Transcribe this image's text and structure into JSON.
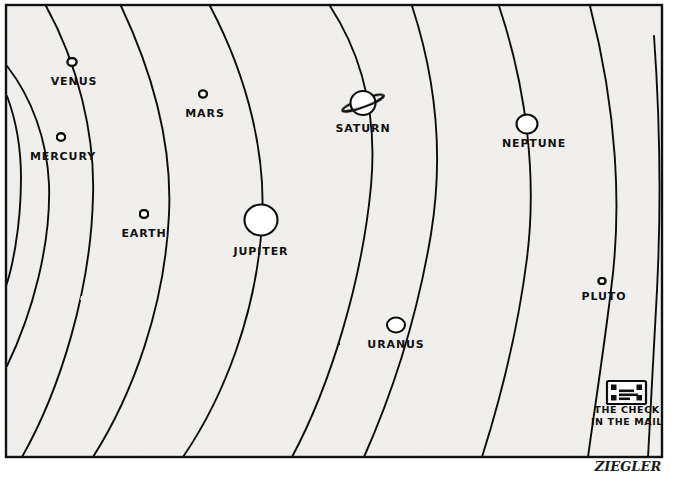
{
  "artwork": {
    "kind": "single-panel-cartoon",
    "medium": "pen-and-ink drawing",
    "subject": "solar system diagram with an extra orbit labeled The Check In The Mail",
    "signature": "ZIEGLER",
    "background_color": "#f2f1ee",
    "ink_color": "#111111",
    "page_color": "#ffffff",
    "frame": {
      "x": 6,
      "y": 5,
      "width": 656,
      "height": 452,
      "stroke": "#111111"
    }
  },
  "caption": {
    "line1": "THE CHECK",
    "line2": "IN THE MAIL"
  },
  "planets": [
    {
      "name": "MERCURY",
      "icon": "small-circle-icon",
      "cx": 61,
      "cy": 137,
      "rx": 4.2,
      "ry": 3.8,
      "label_x": 63,
      "label_y": 160,
      "label_size": 11
    },
    {
      "name": "VENUS",
      "icon": "small-circle-icon",
      "cx": 72,
      "cy": 62,
      "rx": 4.6,
      "ry": 4.0,
      "label_x": 74,
      "label_y": 85,
      "label_size": 11
    },
    {
      "name": "EARTH",
      "icon": "small-circle-icon",
      "cx": 144,
      "cy": 214,
      "rx": 4.3,
      "ry": 4.0,
      "label_x": 144,
      "label_y": 237,
      "label_size": 11
    },
    {
      "name": "MARS",
      "icon": "small-circle-icon",
      "cx": 203,
      "cy": 94,
      "rx": 4.0,
      "ry": 3.6,
      "label_x": 205,
      "label_y": 117,
      "label_size": 11
    },
    {
      "name": "JUPITER",
      "icon": "large-circle-icon",
      "cx": 261,
      "cy": 220,
      "rx": 16.5,
      "ry": 15.5,
      "label_x": 261,
      "label_y": 255,
      "label_size": 11
    },
    {
      "name": "SATURN",
      "icon": "ringed-planet-icon",
      "cx": 363,
      "cy": 103,
      "rx": 12.5,
      "ry": 12.0,
      "label_x": 363,
      "label_y": 132,
      "label_size": 11
    },
    {
      "name": "URANUS",
      "icon": "small-ellipse-icon",
      "cx": 396,
      "cy": 325,
      "rx": 9.0,
      "ry": 7.5,
      "label_x": 396,
      "label_y": 348,
      "label_size": 11
    },
    {
      "name": "NEPTUNE",
      "icon": "medium-circle-icon",
      "cx": 527,
      "cy": 124,
      "rx": 10.5,
      "ry": 9.5,
      "label_x": 534,
      "label_y": 147,
      "label_size": 11
    },
    {
      "name": "PLUTO",
      "icon": "tiny-circle-icon",
      "cx": 602,
      "cy": 281,
      "rx": 3.6,
      "ry": 3.3,
      "label_x": 604,
      "label_y": 300,
      "label_size": 11
    }
  ],
  "check_object": {
    "icon": "check-envelope-icon",
    "x": 607,
    "y": 381,
    "width": 39,
    "height": 23,
    "label_x": 627,
    "label_y": 413,
    "label_size": 9.5
  },
  "orbits": [
    {
      "id": "orbit-mercury",
      "d": "M 7 96 C 16 120 21 150 21 178 C 21 230 11 272 6 286"
    },
    {
      "id": "orbit-venus",
      "d": "M 7 66 C 32 98 47 140 49 184 C 51 244 33 312 7 366"
    },
    {
      "id": "orbit-earth",
      "d": "M 46 6 C 78 64 95 135 93 196 C 91 290 60 390 22 457"
    },
    {
      "id": "orbit-mars",
      "d": "M 121 6 C 155 78 172 150 169 214 C 165 306 133 394 93 457"
    },
    {
      "id": "orbit-jupiter",
      "d": "M 210 6 C 249 80 266 156 262 222 C 257 312 224 397 183 457"
    },
    {
      "id": "orbit-saturn",
      "d": "M 330 6 C 364 58 377 120 371 186 C 362 282 330 386 292 457"
    },
    {
      "id": "orbit-uranus",
      "d": "M 412 6 C 437 82 443 160 431 234 C 417 318 392 394 364 457"
    },
    {
      "id": "orbit-neptune",
      "d": "M 499 6 C 527 90 537 178 527 258 C 518 330 500 400 482 457"
    },
    {
      "id": "orbit-pluto",
      "d": "M 590 6 C 617 110 622 208 611 290 C 604 348 595 406 588 457"
    },
    {
      "id": "orbit-check",
      "d": "M 654 36 C 660 120 661 210 657 290 C 654 352 650 412 648 457"
    }
  ],
  "signature_mark": {
    "text": "ZIEGLER",
    "x": 628,
    "y": 471,
    "size": 13
  }
}
